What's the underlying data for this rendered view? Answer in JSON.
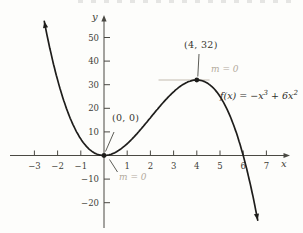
{
  "colors": {
    "curve": "#1e1d1b",
    "axis": "#4a4943",
    "tick_text": "#3f3e38",
    "light_annotation": "#b3aa9c",
    "tangent_line": "#c4bcb0",
    "background": "#fdfdfb"
  },
  "chart_data": {
    "type": "line",
    "curve_label": "f(x) = −x³ + 6x²",
    "curve_label_parts": {
      "prefix": "f(x) = −x",
      "sup1": "3",
      "mid": " + 6x",
      "sup2": "2"
    },
    "function": {
      "expression": "f(x) = -x^3 + 6x^2",
      "coefficients": [
        -1,
        6,
        0,
        0
      ]
    },
    "x_drawn_range": [
      -2.575,
      6.64
    ],
    "axis_range": {
      "x": [
        -4.0,
        7.9
      ],
      "y": [
        -29,
        59
      ]
    },
    "x_ticks": [
      -3,
      -2,
      -1,
      1,
      2,
      3,
      4,
      5,
      6,
      7
    ],
    "y_ticks": [
      -20,
      -10,
      10,
      20,
      30,
      40,
      50
    ],
    "xlabel": "x",
    "ylabel": "y",
    "grid": false,
    "points": [
      {
        "label": "(0, 0)",
        "x": 0,
        "y": 0
      },
      {
        "label": "(4, 32)",
        "x": 4,
        "y": 32
      }
    ],
    "annotations": [
      {
        "text": "m = 0",
        "at_point": "(0, 0)"
      },
      {
        "text": "m = 0",
        "at_point": "(4, 32)"
      }
    ],
    "tangent_at_max": {
      "y": 32,
      "x_from": 2.35,
      "x_to": 4.55
    }
  }
}
